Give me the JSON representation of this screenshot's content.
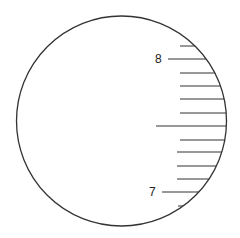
{
  "diagram": {
    "circle": {
      "cx": 121.5,
      "cy": 121,
      "r": 105,
      "stroke": "#333333"
    },
    "labels": [
      {
        "text": "8",
        "x": 155,
        "y": 53
      },
      {
        "text": "7",
        "x": 149,
        "y": 186
      }
    ],
    "ticks": [
      {
        "y": 46,
        "x1": 180,
        "kind": "minor"
      },
      {
        "y": 59,
        "x1": 168,
        "kind": "major",
        "label": "8"
      },
      {
        "y": 73,
        "x1": 180,
        "kind": "minor"
      },
      {
        "y": 86,
        "x1": 180,
        "kind": "minor"
      },
      {
        "y": 99,
        "x1": 180,
        "kind": "minor"
      },
      {
        "y": 113,
        "x1": 180,
        "kind": "minor"
      },
      {
        "y": 126,
        "x1": 156,
        "kind": "half"
      },
      {
        "y": 140,
        "x1": 180,
        "kind": "minor"
      },
      {
        "y": 152,
        "x1": 177,
        "kind": "minor"
      },
      {
        "y": 166,
        "x1": 177,
        "kind": "minor"
      },
      {
        "y": 179,
        "x1": 177,
        "kind": "minor"
      },
      {
        "y": 192,
        "x1": 162,
        "kind": "major",
        "label": "7"
      },
      {
        "y": 206,
        "x1": 178,
        "kind": "minor"
      }
    ]
  }
}
